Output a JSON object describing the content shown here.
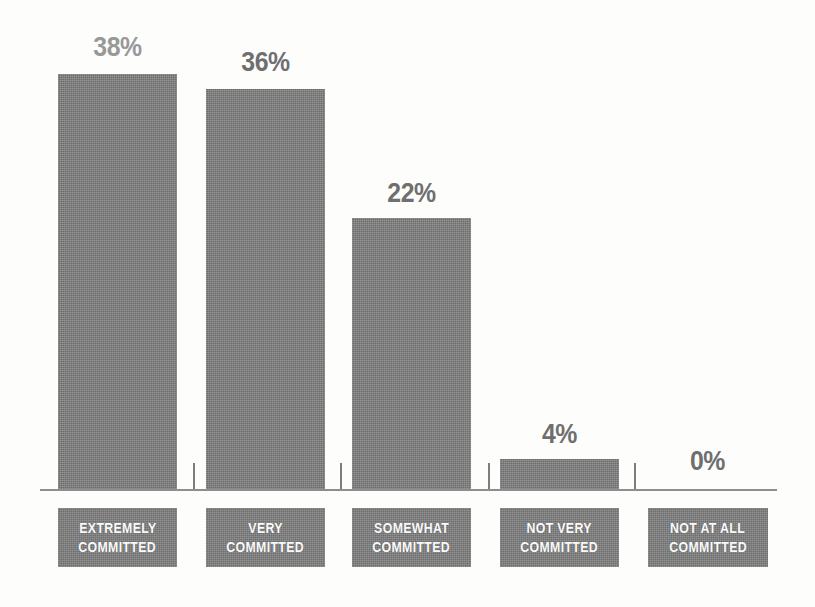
{
  "chart_data": {
    "type": "bar",
    "title": "",
    "subtitle": "",
    "xlabel": "",
    "ylabel": "",
    "categories": [
      "EXTREMELY COMMITTED",
      "VERY COMMITTED",
      "SOMEWHAT COMMITTED",
      "NOT VERY COMMITTED",
      "NOT AT ALL COMMITTED"
    ],
    "category_lines": [
      [
        "EXTREMELY",
        "COMMITTED"
      ],
      [
        "VERY",
        "COMMITTED"
      ],
      [
        "SOMEWHAT",
        "COMMITTED"
      ],
      [
        "NOT VERY",
        "COMMITTED"
      ],
      [
        "NOT AT ALL",
        "COMMITTED"
      ]
    ],
    "values": [
      38,
      36,
      22,
      4,
      0
    ],
    "value_labels": [
      "38%",
      "36%",
      "22%",
      "4%",
      "0%"
    ],
    "ylim": [
      0,
      40
    ],
    "grid": false,
    "legend": "none",
    "axis": "baseline-only",
    "bar_color": "#7c7c7c",
    "label_box_color": "#7c7c7c",
    "label_text_color": "#fafafa",
    "value_label_color": "#6f6f6f",
    "value_label_color_first": "#989898",
    "axis_line_color": "#8e8e8e",
    "background_color": "#fdfdfc"
  },
  "bars": [
    {
      "label": "38%",
      "value": 38,
      "left": 58,
      "width": 119,
      "height": 415,
      "label_left": 58,
      "label_top": 32,
      "faded": true
    },
    {
      "label": "36%",
      "value": 36,
      "left": 206,
      "width": 119,
      "height": 400,
      "label_left": 206,
      "label_top": 47,
      "faded": false
    },
    {
      "label": "22%",
      "value": 22,
      "left": 352,
      "width": 119,
      "height": 271,
      "label_left": 352,
      "label_top": 178,
      "faded": false
    },
    {
      "label": "4%",
      "value": 4,
      "left": 500,
      "width": 119,
      "height": 30,
      "label_left": 500,
      "label_top": 419,
      "faded": false
    },
    {
      "label": "0%",
      "value": 0,
      "left": 648,
      "width": 119,
      "height": 0,
      "label_left": 648,
      "label_top": 446,
      "faded": false
    }
  ],
  "ticks": [
    {
      "left": 193,
      "height": 26
    },
    {
      "left": 340,
      "height": 26
    },
    {
      "left": 488,
      "height": 26
    },
    {
      "left": 634,
      "height": 26
    }
  ],
  "cat_boxes": [
    {
      "left": 58,
      "width": 119
    },
    {
      "left": 206,
      "width": 119
    },
    {
      "left": 352,
      "width": 119
    },
    {
      "left": 500,
      "width": 119
    },
    {
      "left": 648,
      "width": 120
    }
  ]
}
